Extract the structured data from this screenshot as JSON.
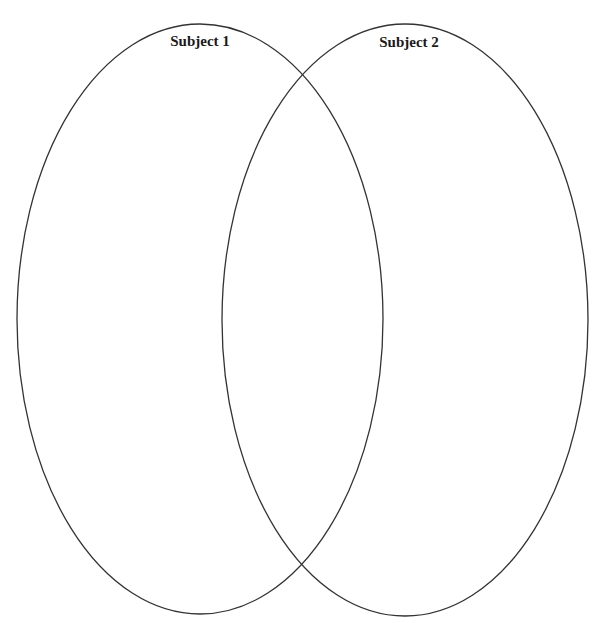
{
  "diagram": {
    "type": "venn",
    "stroke_color": "#333333",
    "background": "#ffffff",
    "sets": [
      {
        "label": "Subject 1",
        "cx": 200,
        "cy": 319,
        "rx": 183,
        "ry": 295,
        "label_x": 200,
        "label_y": 42
      },
      {
        "label": "Subject 2",
        "cx": 405,
        "cy": 320,
        "rx": 183,
        "ry": 296,
        "label_x": 409,
        "label_y": 43
      }
    ]
  }
}
